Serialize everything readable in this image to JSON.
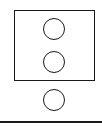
{
  "diagram": {
    "box": {
      "x": 14,
      "y": 10,
      "width": 81,
      "height": 71,
      "stroke": "#1a1a1a"
    },
    "circles": [
      {
        "id": "circle-1",
        "cx": 54,
        "cy": 29,
        "r": 11,
        "inside_box": true
      },
      {
        "id": "circle-2",
        "cx": 54,
        "cy": 62,
        "r": 11,
        "inside_box": true
      },
      {
        "id": "circle-3",
        "cx": 54,
        "cy": 100,
        "r": 11,
        "inside_box": false
      }
    ],
    "base_line": {
      "y": 122,
      "stroke": "#1a1a1a"
    }
  }
}
